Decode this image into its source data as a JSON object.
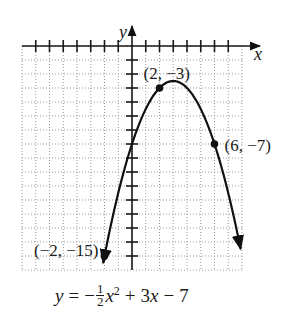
{
  "chart_data": {
    "type": "line",
    "title": "",
    "function": "y = -1/2 x^2 + 3x - 7",
    "coefficients": {
      "a": -0.5,
      "b": 3,
      "c": -7
    },
    "xlabel": "x",
    "ylabel": "y",
    "xlim": [
      -8,
      8
    ],
    "ylim": [
      -16,
      0
    ],
    "grid": true,
    "grid_step": 1,
    "x_ticks": [
      -7,
      -6,
      -5,
      -4,
      -3,
      -2,
      -1,
      1,
      2,
      3,
      4,
      5,
      6,
      7
    ],
    "y_ticks": [
      -1,
      -2,
      -3,
      -4,
      -5,
      -6,
      -7,
      -8,
      -9,
      -10,
      -11,
      -12,
      -13,
      -14,
      -15
    ],
    "curve_x_range": [
      -2.1,
      7.9
    ],
    "arrows_at_ends": true,
    "labeled_points": [
      {
        "x": 2,
        "y": -3,
        "label": "(2, −3)"
      },
      {
        "x": 6,
        "y": -7,
        "label": "(6, −7)"
      },
      {
        "x": -2,
        "y": -15,
        "label": "(−2, −15)"
      }
    ],
    "vertex": {
      "x": 3,
      "y": -2.5
    },
    "tick_labels_shown": false
  },
  "axes": {
    "x_label": "x",
    "y_label": "y"
  },
  "equation": {
    "lhs": "y",
    "equals": "=",
    "minus": "−",
    "frac_num": "1",
    "frac_den": "2",
    "var": "x",
    "exp": "2",
    "rest_plus": "+",
    "rest_term": "3",
    "rest_var": "x",
    "rest_minus": "−",
    "rest_const": "7"
  },
  "colors": {
    "curve": "#111111",
    "axis": "#1a1a1a",
    "grid": "#9a9a9a",
    "point": "#111111"
  }
}
